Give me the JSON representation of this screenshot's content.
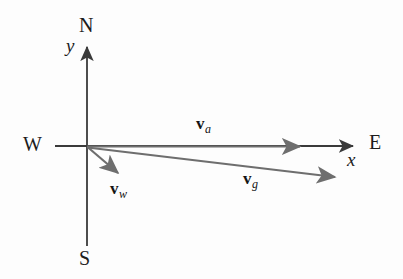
{
  "figure": {
    "background_color": "#fdfdfd",
    "width": 403,
    "height": 279
  },
  "axes": {
    "color": "#3a3a3a",
    "origin": {
      "x": 87,
      "y": 146
    },
    "vertical": {
      "name": "y-axis",
      "label": "y",
      "label_pos": {
        "x": 66,
        "y": 36
      },
      "top_arrow_tip": {
        "x": 87,
        "y": 43
      },
      "bottom_end": {
        "x": 87,
        "y": 246
      }
    },
    "horizontal": {
      "name": "x-axis",
      "label": "x",
      "label_pos": {
        "x": 347,
        "y": 150
      },
      "left_end": {
        "x": 55,
        "y": 146
      },
      "right_arrow_tip": {
        "x": 358,
        "y": 146
      }
    }
  },
  "compass": {
    "north": {
      "label": "N",
      "x": 79,
      "y": 15
    },
    "south": {
      "label": "S",
      "x": 79,
      "y": 248
    },
    "west": {
      "label": "W",
      "x": 23,
      "y": 134
    },
    "east": {
      "label": "E",
      "x": 369,
      "y": 132
    }
  },
  "vectors": [
    {
      "id": "v_a",
      "name": "air-velocity-vector",
      "symbol": "v",
      "subscript": "a",
      "color": "#6e6e6e",
      "start": {
        "x": 87,
        "y": 146
      },
      "end": {
        "x": 306,
        "y": 146
      },
      "label_pos": {
        "x": 196,
        "y": 115
      },
      "description": "velocity of plane relative to air, points due East"
    },
    {
      "id": "v_w",
      "name": "wind-velocity-vector",
      "symbol": "v",
      "subscript": "w",
      "color": "#6e6e6e",
      "start": {
        "x": 87,
        "y": 147
      },
      "end": {
        "x": 123,
        "y": 178
      },
      "label_pos": {
        "x": 110,
        "y": 180
      },
      "description": "velocity of wind, points South-East"
    },
    {
      "id": "v_g",
      "name": "ground-velocity-vector",
      "symbol": "v",
      "subscript": "g",
      "color": "#6e6e6e",
      "start": {
        "x": 87,
        "y": 147
      },
      "end": {
        "x": 341,
        "y": 178
      },
      "label_pos": {
        "x": 243,
        "y": 170
      },
      "description": "velocity of plane relative to ground, resultant"
    }
  ]
}
